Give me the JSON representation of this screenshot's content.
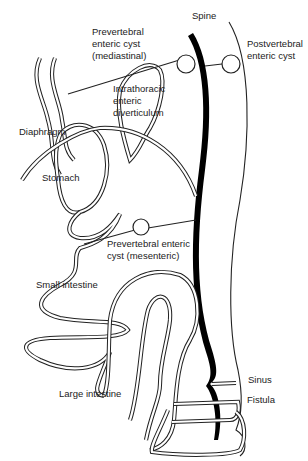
{
  "diagram": {
    "colors": {
      "ink": "#222222",
      "background": "#ffffff",
      "spine": "#000000"
    },
    "labels": {
      "spine": "Spine",
      "prevertebral_mediastinal_1": "Prevertebral",
      "prevertebral_mediastinal_2": "enteric cyst",
      "prevertebral_mediastinal_3": "(mediastinal)",
      "postvertebral_1": "Postvertebral",
      "postvertebral_2": "enteric cyst",
      "intrathoracic_1": "Intrathoracic",
      "intrathoracic_2": "enteric",
      "intrathoracic_3": "diverticulum",
      "diaphragm": "Diaphragm",
      "stomach": "Stomach",
      "prevertebral_mesenteric_1": "Prevertebral enteric",
      "prevertebral_mesenteric_2": "cyst (mesenteric)",
      "small_intestine": "Small intestine",
      "large_intestine": "Large intestine",
      "sinus": "Sinus",
      "fistula": "Fistula"
    }
  }
}
